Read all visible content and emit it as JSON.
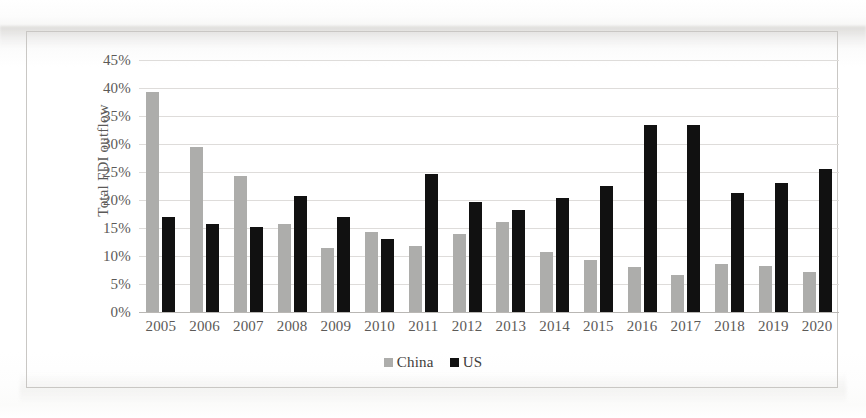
{
  "chart_data": {
    "type": "bar",
    "title": "",
    "xlabel": "",
    "ylabel": "Total FDI outflow",
    "ylim": [
      0,
      45
    ],
    "ytick_labels": [
      "45%",
      "40%",
      "35%",
      "30%",
      "25%",
      "20%",
      "15%",
      "10%",
      "5%",
      "0%"
    ],
    "ytick_values": [
      45,
      40,
      35,
      30,
      25,
      20,
      15,
      10,
      5,
      0
    ],
    "grid": true,
    "legend_position": "bottom",
    "categories": [
      "2005",
      "2006",
      "2007",
      "2008",
      "2009",
      "2010",
      "2011",
      "2012",
      "2013",
      "2014",
      "2015",
      "2016",
      "2017",
      "2018",
      "2019",
      "2020"
    ],
    "series": [
      {
        "name": "China",
        "color": "#adadab",
        "values": [
          39.2,
          29.4,
          24.3,
          15.8,
          11.5,
          14.2,
          11.7,
          13.9,
          16.1,
          10.7,
          9.3,
          8.0,
          6.6,
          8.6,
          8.3,
          7.1
        ]
      },
      {
        "name": "US",
        "color": "#111111",
        "values": [
          17.0,
          15.7,
          15.2,
          20.7,
          17.0,
          13.0,
          24.7,
          19.6,
          18.2,
          20.3,
          22.5,
          33.4,
          33.4,
          21.2,
          23.1,
          25.6
        ]
      }
    ]
  },
  "legend": {
    "items": [
      {
        "label": "China",
        "swatch": "china-swatch-icon"
      },
      {
        "label": "US",
        "swatch": "us-swatch-icon"
      }
    ]
  }
}
